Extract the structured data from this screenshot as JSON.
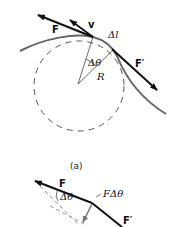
{
  "figure": {
    "part_a": {
      "caption": "(a)",
      "labels": {
        "force": "F",
        "velocity": "v",
        "arc_length": "Δl",
        "force_prime": "F′",
        "angle": "Δθ",
        "radius": "R"
      }
    },
    "part_b": {
      "labels": {
        "force": "F",
        "angle": "Δθ",
        "change": "FΔθ",
        "force_prime": "F′"
      }
    },
    "colors": {
      "vector": "#111111",
      "curve": "#666666",
      "dashed": "#555555",
      "change_arrow": "#777777"
    }
  }
}
